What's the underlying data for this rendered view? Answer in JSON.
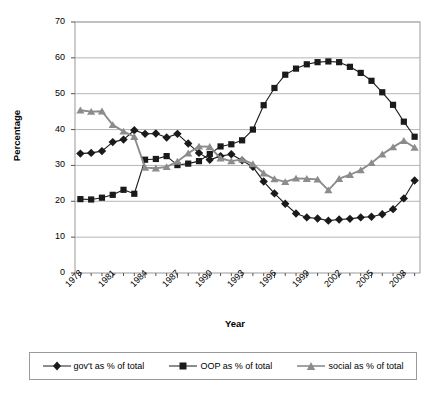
{
  "chart_data": {
    "type": "line",
    "title": "",
    "xlabel": "Year",
    "ylabel": "Percentage",
    "xlim": [
      1978,
      2009
    ],
    "ylim": [
      0,
      70
    ],
    "ytick_values": [
      0,
      10,
      20,
      30,
      40,
      50,
      60,
      70
    ],
    "xtick_labels": [
      "1978",
      "1981",
      "1984",
      "1987",
      "1990",
      "1993",
      "1996",
      "1999",
      "2002",
      "2005",
      "2008"
    ],
    "xtick_values": [
      1978,
      1981,
      1984,
      1987,
      1990,
      1993,
      1996,
      1999,
      2002,
      2005,
      2008
    ],
    "grid": "horizontal",
    "legend_position": "bottom",
    "x": [
      1978,
      1979,
      1980,
      1981,
      1982,
      1983,
      1984,
      1985,
      1986,
      1987,
      1988,
      1989,
      1990,
      1991,
      1992,
      1993,
      1994,
      1995,
      1996,
      1997,
      1998,
      1999,
      2000,
      2001,
      2002,
      2003,
      2004,
      2005,
      2006,
      2007,
      2008,
      2009
    ],
    "series": [
      {
        "name": "gov't as % of total",
        "marker": "diamond",
        "color": "#1a1a1a",
        "values": [
          33.3,
          33.5,
          34.0,
          36.5,
          37.2,
          39.8,
          38.8,
          38.9,
          37.8,
          38.8,
          36.1,
          33.5,
          31.6,
          32.6,
          33.1,
          31.4,
          29.6,
          25.5,
          22.2,
          19.3,
          16.6,
          15.5,
          15.2,
          14.6,
          14.9,
          15.1,
          15.5,
          15.7,
          16.4,
          17.8,
          20.8,
          25.8
        ]
      },
      {
        "name": "OOP as % of total",
        "marker": "square",
        "color": "#1a1a1a",
        "values": [
          20.6,
          20.5,
          21.0,
          21.8,
          23.2,
          22.1,
          31.6,
          31.8,
          32.6,
          30.1,
          30.5,
          31.2,
          33.2,
          35.3,
          35.9,
          37.0,
          40.0,
          46.8,
          51.6,
          55.3,
          57.0,
          58.2,
          58.8,
          59.0,
          58.8,
          57.5,
          55.8,
          53.6,
          50.4,
          46.9,
          42.2,
          38.0
        ]
      },
      {
        "name": "social as % of total",
        "marker": "triangle",
        "color": "#8c8c8c",
        "values": [
          45.4,
          45.0,
          45.1,
          41.3,
          39.5,
          38.0,
          29.4,
          29.2,
          29.6,
          31.1,
          33.4,
          35.3,
          35.2,
          32.0,
          31.2,
          31.7,
          30.4,
          27.8,
          26.2,
          25.4,
          26.4,
          26.3,
          26.1,
          23.1,
          26.3,
          27.4,
          28.7,
          30.7,
          33.1,
          35.1,
          36.9,
          35.0
        ]
      }
    ]
  },
  "legend": {
    "items": [
      {
        "label": "gov't as % of total"
      },
      {
        "label": "OOP as % of total"
      },
      {
        "label": "social as % of total"
      }
    ]
  }
}
